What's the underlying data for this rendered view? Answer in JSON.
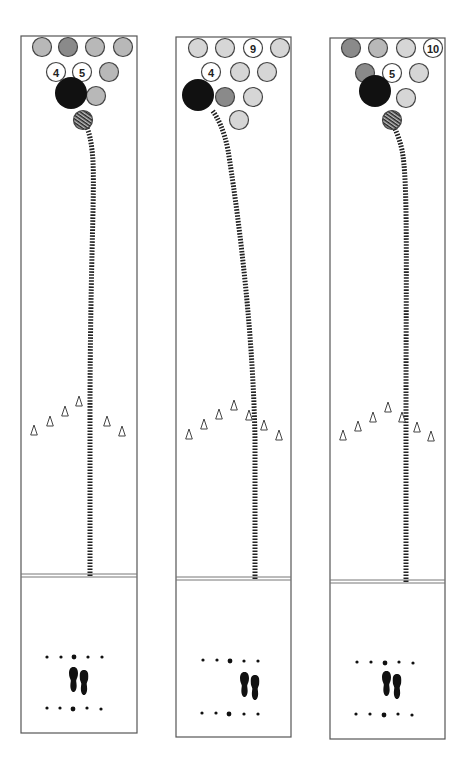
{
  "colors": {
    "pin_light": "#d6d6d6",
    "pin_mid": "#b8b8b8",
    "pin_dark": "#8a8a8a",
    "pin_standing": "#ffffff",
    "ball": "#111111",
    "track": "#222222"
  },
  "lanes": [
    {
      "id": "lane-1",
      "x": 21,
      "y": 36,
      "w": 116,
      "foul_y": 574,
      "bottom_y": 733,
      "pins": [
        {
          "x": 42,
          "y": 47,
          "tone": "pin_mid",
          "label": ""
        },
        {
          "x": 68,
          "y": 47,
          "tone": "pin_dark",
          "label": ""
        },
        {
          "x": 95,
          "y": 47,
          "tone": "pin_mid",
          "label": ""
        },
        {
          "x": 123,
          "y": 47,
          "tone": "pin_mid",
          "label": ""
        },
        {
          "x": 56,
          "y": 72,
          "tone": "pin_standing",
          "label": "4"
        },
        {
          "x": 82,
          "y": 72,
          "tone": "pin_standing",
          "label": "5"
        },
        {
          "x": 109,
          "y": 72,
          "tone": "pin_mid",
          "label": ""
        },
        {
          "x": 96,
          "y": 96,
          "tone": "pin_mid",
          "label": ""
        },
        {
          "x": 83,
          "y": 120,
          "tone": "pin_mid",
          "label": "",
          "hatched": true
        }
      ],
      "ball": {
        "x": 71,
        "y": 93,
        "r": 16
      },
      "track": "M 90 576 L 90 420 C 90 250, 96 180, 92 150 C 90 132, 86 125, 84 122",
      "arrows": [
        {
          "x": 34,
          "y": 430
        },
        {
          "x": 50,
          "y": 421
        },
        {
          "x": 65,
          "y": 411
        },
        {
          "x": 79,
          "y": 401
        },
        {
          "x": 107,
          "y": 421
        },
        {
          "x": 122,
          "y": 431
        }
      ],
      "dots_top": [
        {
          "x": 47,
          "y": 657,
          "big": false
        },
        {
          "x": 61,
          "y": 657,
          "big": false
        },
        {
          "x": 74,
          "y": 657,
          "big": true
        },
        {
          "x": 88,
          "y": 657,
          "big": false
        },
        {
          "x": 102,
          "y": 657,
          "big": false
        }
      ],
      "dots_bottom": [
        {
          "x": 47,
          "y": 708,
          "big": false
        },
        {
          "x": 60,
          "y": 708,
          "big": false
        },
        {
          "x": 73,
          "y": 709,
          "big": true
        },
        {
          "x": 87,
          "y": 708,
          "big": false
        },
        {
          "x": 101,
          "y": 709,
          "big": false
        }
      ],
      "feet": {
        "x": 79,
        "y": 680
      }
    },
    {
      "id": "lane-2",
      "x": 176,
      "y": 37,
      "w": 115,
      "foul_y": 577,
      "bottom_y": 737,
      "pins": [
        {
          "x": 198,
          "y": 48,
          "tone": "pin_light",
          "label": ""
        },
        {
          "x": 225,
          "y": 48,
          "tone": "pin_light",
          "label": ""
        },
        {
          "x": 253,
          "y": 48,
          "tone": "pin_standing",
          "label": "9"
        },
        {
          "x": 280,
          "y": 48,
          "tone": "pin_light",
          "label": ""
        },
        {
          "x": 211,
          "y": 72,
          "tone": "pin_standing",
          "label": "4"
        },
        {
          "x": 240,
          "y": 72,
          "tone": "pin_light",
          "label": ""
        },
        {
          "x": 267,
          "y": 72,
          "tone": "pin_light",
          "label": ""
        },
        {
          "x": 225,
          "y": 97,
          "tone": "pin_dark",
          "label": ""
        },
        {
          "x": 253,
          "y": 97,
          "tone": "pin_light",
          "label": ""
        },
        {
          "x": 239,
          "y": 120,
          "tone": "pin_light",
          "label": ""
        }
      ],
      "ball": {
        "x": 198,
        "y": 95,
        "r": 16
      },
      "track": "M 255 579 L 255 440 C 253 320, 236 200, 228 150 C 224 130, 218 118, 212 110",
      "arrows": [
        {
          "x": 189,
          "y": 434
        },
        {
          "x": 204,
          "y": 424
        },
        {
          "x": 219,
          "y": 414
        },
        {
          "x": 234,
          "y": 405
        },
        {
          "x": 249,
          "y": 415
        },
        {
          "x": 264,
          "y": 425
        },
        {
          "x": 279,
          "y": 435
        }
      ],
      "dots_top": [
        {
          "x": 203,
          "y": 660,
          "big": false
        },
        {
          "x": 217,
          "y": 660,
          "big": false
        },
        {
          "x": 230,
          "y": 661,
          "big": true
        },
        {
          "x": 244,
          "y": 661,
          "big": false
        },
        {
          "x": 258,
          "y": 661,
          "big": false
        }
      ],
      "dots_bottom": [
        {
          "x": 202,
          "y": 713,
          "big": false
        },
        {
          "x": 216,
          "y": 713,
          "big": false
        },
        {
          "x": 229,
          "y": 714,
          "big": true
        },
        {
          "x": 244,
          "y": 714,
          "big": false
        },
        {
          "x": 258,
          "y": 714,
          "big": false
        }
      ],
      "feet": {
        "x": 250,
        "y": 685
      }
    },
    {
      "id": "lane-3",
      "x": 330,
      "y": 38,
      "w": 115,
      "foul_y": 580,
      "bottom_y": 739,
      "pins": [
        {
          "x": 351,
          "y": 48,
          "tone": "pin_dark",
          "label": ""
        },
        {
          "x": 378,
          "y": 48,
          "tone": "pin_mid",
          "label": ""
        },
        {
          "x": 406,
          "y": 48,
          "tone": "pin_light",
          "label": ""
        },
        {
          "x": 433,
          "y": 48,
          "tone": "pin_standing",
          "label": "10"
        },
        {
          "x": 365,
          "y": 73,
          "tone": "pin_dark",
          "label": ""
        },
        {
          "x": 392,
          "y": 73,
          "tone": "pin_standing",
          "label": "5"
        },
        {
          "x": 419,
          "y": 73,
          "tone": "pin_light",
          "label": ""
        },
        {
          "x": 406,
          "y": 98,
          "tone": "pin_light",
          "label": ""
        },
        {
          "x": 392,
          "y": 120,
          "tone": "pin_dark",
          "label": "",
          "hatched": true
        }
      ],
      "ball": {
        "x": 375,
        "y": 91,
        "r": 16
      },
      "track": "M 406 582 L 406 420 C 406 260, 408 180, 402 150 C 398 132, 392 123, 386 112",
      "arrows": [
        {
          "x": 343,
          "y": 435
        },
        {
          "x": 358,
          "y": 426
        },
        {
          "x": 373,
          "y": 417
        },
        {
          "x": 388,
          "y": 407
        },
        {
          "x": 402,
          "y": 417
        },
        {
          "x": 417,
          "y": 427
        },
        {
          "x": 431,
          "y": 436
        }
      ],
      "dots_top": [
        {
          "x": 357,
          "y": 662,
          "big": false
        },
        {
          "x": 371,
          "y": 662,
          "big": false
        },
        {
          "x": 385,
          "y": 663,
          "big": true
        },
        {
          "x": 399,
          "y": 662,
          "big": false
        },
        {
          "x": 413,
          "y": 663,
          "big": false
        }
      ],
      "dots_bottom": [
        {
          "x": 356,
          "y": 714,
          "big": false
        },
        {
          "x": 370,
          "y": 714,
          "big": false
        },
        {
          "x": 384,
          "y": 715,
          "big": true
        },
        {
          "x": 398,
          "y": 714,
          "big": false
        },
        {
          "x": 412,
          "y": 715,
          "big": false
        }
      ],
      "feet": {
        "x": 392,
        "y": 684
      }
    }
  ]
}
